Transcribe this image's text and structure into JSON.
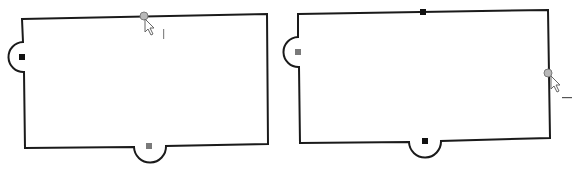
{
  "diagram": {
    "colors": {
      "outline": "#1a1a1a",
      "black_marker": "#111111",
      "gray_marker": "#7a7a7a",
      "hover_point_fill": "#b8b8b8",
      "hover_point_stroke": "#7a7a7a"
    },
    "shapes": [
      {
        "id": "shape-left",
        "tabs": [
          "left",
          "bottom"
        ],
        "markers": [
          {
            "position": "left-tab",
            "color": "black"
          },
          {
            "position": "bottom-tab",
            "color": "gray"
          }
        ],
        "hover_point": "top-edge"
      },
      {
        "id": "shape-right",
        "tabs": [
          "left",
          "bottom"
        ],
        "markers": [
          {
            "position": "top-edge",
            "color": "black"
          },
          {
            "position": "left-tab",
            "color": "gray"
          },
          {
            "position": "bottom-tab",
            "color": "black"
          }
        ],
        "hover_point": "right-edge"
      }
    ],
    "cursor_icon": "arrow-pointer"
  }
}
